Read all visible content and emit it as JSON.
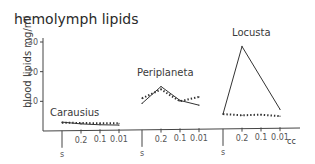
{
  "chart_data": {
    "type": "line",
    "title": "hemolymph lipids",
    "ylabel": "blood lipids  mg/ml",
    "xlabel_unit": "cc",
    "ylim": [
      0,
      30
    ],
    "yticks": [
      10,
      20,
      30
    ],
    "x_categories": [
      "s",
      "0.2",
      "0.1",
      "0.01"
    ],
    "x_tick_labels": [
      "s",
      "0.2",
      "0.1",
      "0.01"
    ],
    "panels": [
      {
        "name": "Carausius",
        "series": [
          {
            "name": "solid",
            "style": "solid",
            "values": [
              3.0,
              2.4,
              2.1,
              2.0
            ]
          },
          {
            "name": "dotted",
            "style": "dotted",
            "values": [
              2.8,
              2.7,
              2.6,
              2.6
            ]
          }
        ]
      },
      {
        "name": "Periplaneta",
        "series": [
          {
            "name": "solid",
            "style": "solid",
            "values": [
              9.3,
              15.0,
              10.3,
              8.7
            ]
          },
          {
            "name": "dotted",
            "style": "dotted",
            "values": [
              11.0,
              14.0,
              10.0,
              11.5
            ]
          }
        ]
      },
      {
        "name": "Locusta",
        "series": [
          {
            "name": "solid",
            "style": "solid",
            "values": [
              5.7,
              28.5,
              null,
              7.3
            ]
          },
          {
            "name": "dotted",
            "style": "dotted",
            "values": [
              5.7,
              5.3,
              5.5,
              5.0
            ]
          }
        ]
      }
    ]
  }
}
